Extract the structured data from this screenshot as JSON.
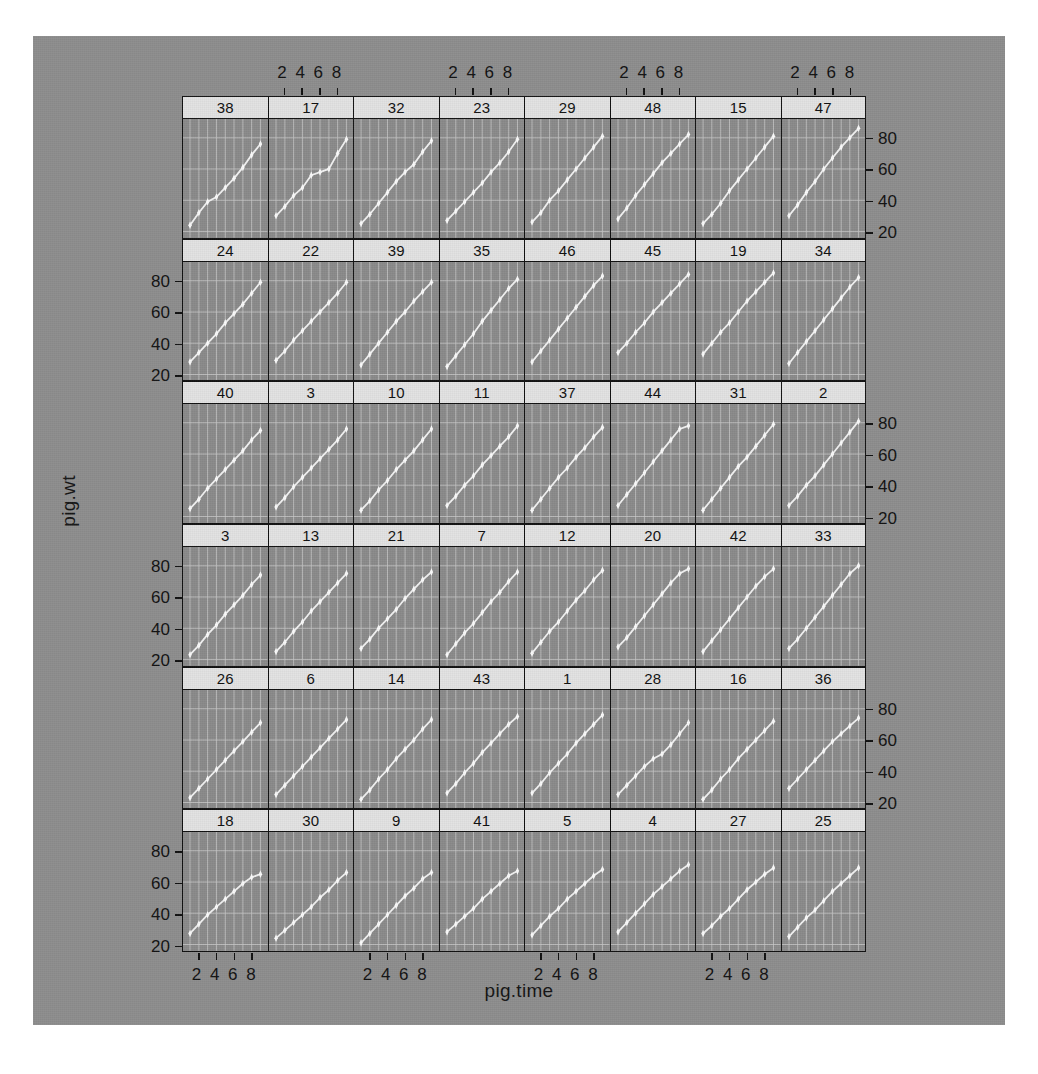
{
  "figure": {
    "type": "trellis-scatter-grid",
    "x_axis_title": "pig.time",
    "y_axis_title": "pig.wt",
    "x_ticks": [
      2,
      4,
      6,
      8
    ],
    "y_ticks": [
      20,
      40,
      60,
      80
    ],
    "x_tick_label_text": "2 4 6 8",
    "x_range": [
      0.2,
      9.8
    ],
    "y_range": [
      16,
      92
    ],
    "rows": 6,
    "cols": 8,
    "panel_bg_color": "#8a8a8a",
    "strip_bg_color": "#e2e2e2",
    "gridline_color": "#c9c9c9",
    "point_color": "#fbfbfb",
    "border_color": "#111111",
    "canvas_color": "#8d8d8d"
  },
  "chart_data": {
    "type": "line",
    "title": "",
    "xlabel": "pig.time",
    "ylabel": "pig.wt",
    "xlim": [
      0.2,
      9.8
    ],
    "ylim": [
      16,
      92
    ],
    "grid": true,
    "legend": "none",
    "x": [
      1,
      2,
      3,
      4,
      5,
      6,
      7,
      8,
      9
    ],
    "panel_layout": {
      "rows": 6,
      "cols": 8,
      "order": "row-major-top-left"
    },
    "panels": [
      {
        "id": "38",
        "row": 1,
        "col": 1,
        "values": [
          24,
          32,
          39,
          42,
          48,
          54,
          61,
          69,
          76
        ]
      },
      {
        "id": "17",
        "row": 1,
        "col": 2,
        "values": [
          30,
          36,
          43,
          48,
          56,
          58,
          60,
          70,
          79
        ]
      },
      {
        "id": "32",
        "row": 1,
        "col": 3,
        "values": [
          25,
          31,
          38,
          45,
          52,
          58,
          63,
          71,
          78
        ]
      },
      {
        "id": "23",
        "row": 1,
        "col": 4,
        "values": [
          27,
          33,
          39,
          45,
          51,
          58,
          64,
          71,
          79
        ]
      },
      {
        "id": "29",
        "row": 1,
        "col": 5,
        "values": [
          26,
          32,
          40,
          46,
          53,
          60,
          67,
          74,
          81
        ]
      },
      {
        "id": "48",
        "row": 1,
        "col": 6,
        "values": [
          28,
          35,
          43,
          50,
          57,
          64,
          70,
          76,
          82
        ]
      },
      {
        "id": "15",
        "row": 1,
        "col": 7,
        "values": [
          25,
          31,
          38,
          46,
          53,
          60,
          67,
          74,
          81
        ]
      },
      {
        "id": "47",
        "row": 1,
        "col": 8,
        "values": [
          30,
          37,
          45,
          52,
          60,
          67,
          74,
          80,
          86
        ]
      },
      {
        "id": "24",
        "row": 2,
        "col": 1,
        "values": [
          28,
          34,
          40,
          46,
          53,
          59,
          65,
          72,
          79
        ]
      },
      {
        "id": "22",
        "row": 2,
        "col": 2,
        "values": [
          29,
          35,
          42,
          48,
          54,
          60,
          66,
          72,
          79
        ]
      },
      {
        "id": "39",
        "row": 2,
        "col": 3,
        "values": [
          26,
          33,
          40,
          47,
          54,
          60,
          67,
          73,
          79
        ]
      },
      {
        "id": "35",
        "row": 2,
        "col": 4,
        "values": [
          25,
          32,
          39,
          46,
          54,
          61,
          68,
          75,
          81
        ]
      },
      {
        "id": "46",
        "row": 2,
        "col": 5,
        "values": [
          28,
          35,
          42,
          49,
          56,
          63,
          70,
          77,
          83
        ]
      },
      {
        "id": "45",
        "row": 2,
        "col": 6,
        "values": [
          34,
          40,
          47,
          53,
          60,
          66,
          72,
          78,
          84
        ]
      },
      {
        "id": "19",
        "row": 2,
        "col": 7,
        "values": [
          33,
          40,
          47,
          53,
          60,
          67,
          73,
          79,
          85
        ]
      },
      {
        "id": "34",
        "row": 2,
        "col": 8,
        "values": [
          27,
          34,
          41,
          48,
          55,
          62,
          69,
          76,
          82
        ]
      },
      {
        "id": "40",
        "row": 3,
        "col": 1,
        "values": [
          25,
          31,
          38,
          44,
          50,
          56,
          62,
          69,
          75
        ]
      },
      {
        "id": "3",
        "row": 3,
        "col": 2,
        "values": [
          26,
          32,
          39,
          45,
          51,
          57,
          63,
          69,
          76
        ]
      },
      {
        "id": "10",
        "row": 3,
        "col": 3,
        "values": [
          24,
          30,
          37,
          43,
          50,
          56,
          62,
          69,
          76
        ]
      },
      {
        "id": "11",
        "row": 3,
        "col": 4,
        "values": [
          27,
          33,
          40,
          46,
          53,
          59,
          65,
          71,
          78
        ]
      },
      {
        "id": "37",
        "row": 3,
        "col": 5,
        "values": [
          24,
          31,
          38,
          45,
          51,
          58,
          64,
          71,
          77
        ]
      },
      {
        "id": "44",
        "row": 3,
        "col": 6,
        "values": [
          27,
          34,
          41,
          48,
          55,
          62,
          69,
          76,
          78
        ]
      },
      {
        "id": "31",
        "row": 3,
        "col": 7,
        "values": [
          24,
          31,
          38,
          45,
          52,
          58,
          65,
          72,
          79
        ]
      },
      {
        "id": "2",
        "row": 3,
        "col": 8,
        "values": [
          27,
          33,
          40,
          46,
          53,
          60,
          67,
          74,
          81
        ]
      },
      {
        "id": "3",
        "row": 4,
        "col": 1,
        "values": [
          23,
          29,
          36,
          42,
          49,
          55,
          61,
          68,
          74
        ]
      },
      {
        "id": "13",
        "row": 4,
        "col": 2,
        "values": [
          25,
          31,
          38,
          44,
          51,
          57,
          63,
          69,
          75
        ]
      },
      {
        "id": "21",
        "row": 4,
        "col": 3,
        "values": [
          27,
          33,
          40,
          46,
          52,
          59,
          65,
          71,
          76
        ]
      },
      {
        "id": "7",
        "row": 4,
        "col": 4,
        "values": [
          23,
          30,
          37,
          43,
          50,
          57,
          63,
          70,
          76
        ]
      },
      {
        "id": "12",
        "row": 4,
        "col": 5,
        "values": [
          24,
          31,
          38,
          44,
          51,
          58,
          64,
          71,
          77
        ]
      },
      {
        "id": "20",
        "row": 4,
        "col": 6,
        "values": [
          28,
          34,
          41,
          48,
          55,
          62,
          69,
          75,
          78
        ]
      },
      {
        "id": "42",
        "row": 4,
        "col": 7,
        "values": [
          25,
          32,
          39,
          46,
          53,
          60,
          67,
          73,
          78
        ]
      },
      {
        "id": "33",
        "row": 4,
        "col": 8,
        "values": [
          27,
          33,
          40,
          47,
          54,
          61,
          68,
          75,
          80
        ]
      },
      {
        "id": "26",
        "row": 5,
        "col": 1,
        "values": [
          23,
          29,
          35,
          41,
          47,
          53,
          59,
          65,
          71
        ]
      },
      {
        "id": "6",
        "row": 5,
        "col": 2,
        "values": [
          25,
          31,
          37,
          43,
          49,
          55,
          61,
          67,
          73
        ]
      },
      {
        "id": "14",
        "row": 5,
        "col": 3,
        "values": [
          22,
          28,
          35,
          41,
          48,
          54,
          60,
          67,
          73
        ]
      },
      {
        "id": "43",
        "row": 5,
        "col": 4,
        "values": [
          26,
          32,
          39,
          45,
          52,
          58,
          64,
          70,
          75
        ]
      },
      {
        "id": "1",
        "row": 5,
        "col": 5,
        "values": [
          26,
          32,
          39,
          45,
          51,
          58,
          64,
          70,
          76
        ]
      },
      {
        "id": "28",
        "row": 5,
        "col": 6,
        "values": [
          25,
          31,
          37,
          43,
          48,
          51,
          57,
          64,
          71
        ]
      },
      {
        "id": "16",
        "row": 5,
        "col": 7,
        "values": [
          22,
          28,
          35,
          41,
          48,
          54,
          60,
          66,
          72
        ]
      },
      {
        "id": "36",
        "row": 5,
        "col": 8,
        "values": [
          29,
          35,
          41,
          47,
          53,
          59,
          64,
          69,
          74
        ]
      },
      {
        "id": "18",
        "row": 6,
        "col": 1,
        "values": [
          27,
          33,
          39,
          44,
          49,
          54,
          59,
          63,
          65
        ]
      },
      {
        "id": "30",
        "row": 6,
        "col": 2,
        "values": [
          24,
          29,
          34,
          39,
          44,
          50,
          55,
          61,
          66
        ]
      },
      {
        "id": "9",
        "row": 6,
        "col": 3,
        "values": [
          21,
          27,
          33,
          39,
          45,
          51,
          56,
          62,
          66
        ]
      },
      {
        "id": "41",
        "row": 6,
        "col": 4,
        "values": [
          28,
          33,
          38,
          43,
          49,
          54,
          59,
          64,
          67
        ]
      },
      {
        "id": "5",
        "row": 6,
        "col": 5,
        "values": [
          26,
          32,
          38,
          43,
          49,
          54,
          59,
          64,
          68
        ]
      },
      {
        "id": "4",
        "row": 6,
        "col": 6,
        "values": [
          28,
          34,
          40,
          46,
          52,
          57,
          62,
          67,
          71
        ]
      },
      {
        "id": "27",
        "row": 6,
        "col": 7,
        "values": [
          27,
          32,
          38,
          43,
          49,
          55,
          60,
          65,
          69
        ]
      },
      {
        "id": "25",
        "row": 6,
        "col": 8,
        "values": [
          25,
          31,
          37,
          42,
          48,
          54,
          59,
          64,
          69
        ]
      }
    ]
  }
}
